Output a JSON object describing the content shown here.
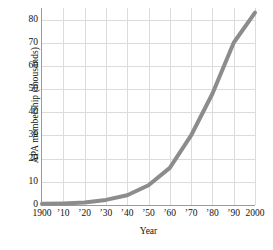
{
  "chart_data": {
    "type": "line",
    "title": "",
    "xlabel": "Year",
    "ylabel": "APA membership (thousands)",
    "xlim": [
      1900,
      2000
    ],
    "ylim": [
      0,
      85
    ],
    "grid": true,
    "legend": null,
    "line_color": "#8c8c8c",
    "grid_color": "#dcdcdc",
    "axis_color": "#9a9a9a",
    "x_tick_values": [
      1900,
      1910,
      1920,
      1930,
      1940,
      1950,
      1960,
      1970,
      1980,
      1990,
      2000
    ],
    "x_tick_labels": [
      "1900",
      "’10",
      "’20",
      "’30",
      "’40",
      "’50",
      "’60",
      "’70",
      "’80",
      "’90",
      "2000"
    ],
    "y_tick_values": [
      0,
      10,
      20,
      30,
      40,
      50,
      60,
      70,
      80
    ],
    "y_tick_labels": [
      "0",
      "10",
      "20",
      "30",
      "40",
      "50",
      "60",
      "70",
      "80"
    ],
    "series": [
      {
        "name": "APA membership",
        "x": [
          1900,
          1910,
          1920,
          1930,
          1940,
          1950,
          1960,
          1970,
          1980,
          1990,
          2000
        ],
        "values": [
          0.5,
          0.7,
          1.1,
          2.2,
          4.2,
          8.5,
          16,
          30,
          48,
          70,
          83
        ]
      }
    ]
  }
}
